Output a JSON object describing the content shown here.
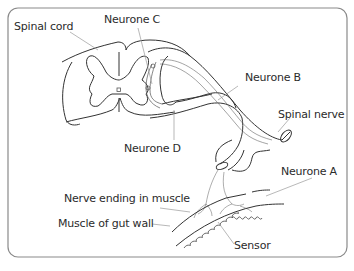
{
  "diagram": {
    "labels": {
      "spinal_cord": "Spinal cord",
      "neurone_c": "Neurone C",
      "neurone_b": "Neurone B",
      "spinal_nerve": "Spinal nerve",
      "neurone_d": "Neurone D",
      "neurone_a": "Neurone A",
      "nerve_ending": "Nerve ending in muscle",
      "muscle_gut_wall": "Muscle of gut wall",
      "sensor": "Sensor"
    },
    "colors": {
      "frame": "#888888",
      "outline": "#333333",
      "leader": "#999999",
      "text": "#2b2b2b"
    }
  }
}
